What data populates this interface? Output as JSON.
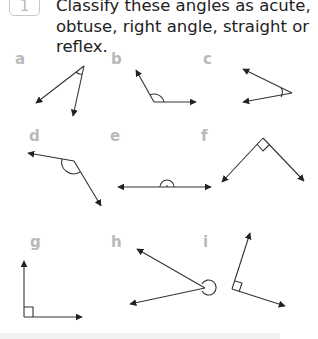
{
  "question": {
    "number": "1",
    "prompt": "Classify these angles as acute, obtuse, right angle, straight or reflex."
  },
  "angles": [
    {
      "label": "a",
      "type_hint": "acute",
      "marker": "arc"
    },
    {
      "label": "b",
      "type_hint": "obtuse",
      "marker": "arc"
    },
    {
      "label": "c",
      "type_hint": "acute",
      "marker": "arc"
    },
    {
      "label": "d",
      "type_hint": "obtuse",
      "marker": "arc"
    },
    {
      "label": "e",
      "type_hint": "straight",
      "marker": "semicircle"
    },
    {
      "label": "f",
      "type_hint": "right angle",
      "marker": "square"
    },
    {
      "label": "g",
      "type_hint": "right angle",
      "marker": "square"
    },
    {
      "label": "h",
      "type_hint": "reflex",
      "marker": "circle"
    },
    {
      "label": "i",
      "type_hint": "right angle",
      "marker": "square"
    }
  ],
  "colors": {
    "line": "#333333",
    "label": "#b9b9b9",
    "text": "#222222",
    "footer": "#f1f1f1"
  }
}
